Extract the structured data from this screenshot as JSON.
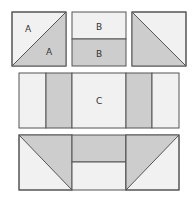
{
  "colors": {
    "light": "#f1f1f1",
    "gray": "#cdcdcd",
    "stroke": "#555555",
    "background": "#ffffff"
  },
  "blocks": {
    "a": {
      "label_top": "A",
      "label_bottom": "A"
    },
    "b": {
      "label_top": "B",
      "label_bottom": "B"
    },
    "c": {
      "label": "C"
    }
  }
}
